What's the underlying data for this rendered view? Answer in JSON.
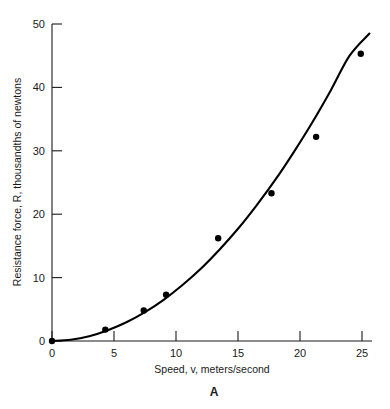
{
  "figure": {
    "panel_letter": "A",
    "background_color": "#ffffff",
    "ink_color": "#000000"
  },
  "chart_data": {
    "type": "scatter",
    "title": "",
    "subtitle": "",
    "xlabel": "Speed, v, meters/second",
    "ylabel": "Resistance force, R, thousandths of newtons",
    "xlim": [
      0,
      26.2
    ],
    "ylim": [
      0,
      50
    ],
    "xticks": [
      0,
      5,
      10,
      15,
      20,
      25
    ],
    "xtick_labels": [
      "0",
      "5",
      "10",
      "15",
      "20",
      "25"
    ],
    "yticks": [
      0,
      10,
      20,
      30,
      40,
      50
    ],
    "ytick_labels": [
      "0",
      "10",
      "20",
      "30",
      "40",
      "50"
    ],
    "grid": false,
    "legend": false,
    "legend_position": "none",
    "annotations": [
      "A"
    ],
    "series": [
      {
        "name": "Measured resistance",
        "type": "scatter",
        "marker": "filled-circle",
        "marker_color": "#000000",
        "x": [
          0,
          4.3,
          7.4,
          9.2,
          13.4,
          17.7,
          21.3,
          24.9
        ],
        "y": [
          0,
          1.8,
          4.8,
          7.3,
          16.2,
          23.3,
          32.2,
          45.3
        ]
      },
      {
        "name": "Fitted curve",
        "type": "line",
        "line_color": "#000000",
        "x": [
          0,
          1.5,
          3,
          4.5,
          6,
          7.5,
          9,
          10.5,
          12,
          13.5,
          15,
          16.5,
          18,
          19.5,
          21,
          22.5,
          24,
          25.6
        ],
        "y": [
          0,
          0.2,
          0.75,
          1.7,
          2.95,
          4.55,
          6.5,
          8.8,
          11.4,
          14.4,
          17.7,
          21.4,
          25.4,
          29.8,
          34.5,
          39.6,
          45.0,
          48.5
        ]
      }
    ]
  }
}
